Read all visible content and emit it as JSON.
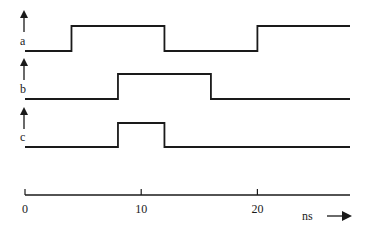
{
  "diagram": {
    "type": "timing-diagram",
    "signals": [
      {
        "name": "a",
        "initial": 0,
        "transitions": [
          {
            "t": 4,
            "to": 1
          },
          {
            "t": 12,
            "to": 0
          },
          {
            "t": 20,
            "to": 1
          }
        ]
      },
      {
        "name": "b",
        "initial": 0,
        "transitions": [
          {
            "t": 8,
            "to": 1
          },
          {
            "t": 16,
            "to": 0
          }
        ]
      },
      {
        "name": "c",
        "initial": 0,
        "transitions": [
          {
            "t": 8,
            "to": 1
          },
          {
            "t": 12,
            "to": 0
          }
        ]
      }
    ],
    "time_axis": {
      "start": 0,
      "end": 28,
      "ticks": [
        {
          "value": 0,
          "label": "0"
        },
        {
          "value": 10,
          "label": "10"
        },
        {
          "value": 20,
          "label": "20"
        }
      ],
      "unit_label": "ns"
    },
    "colors": {
      "line": "#1a1a1a",
      "background": "#ffffff"
    }
  }
}
